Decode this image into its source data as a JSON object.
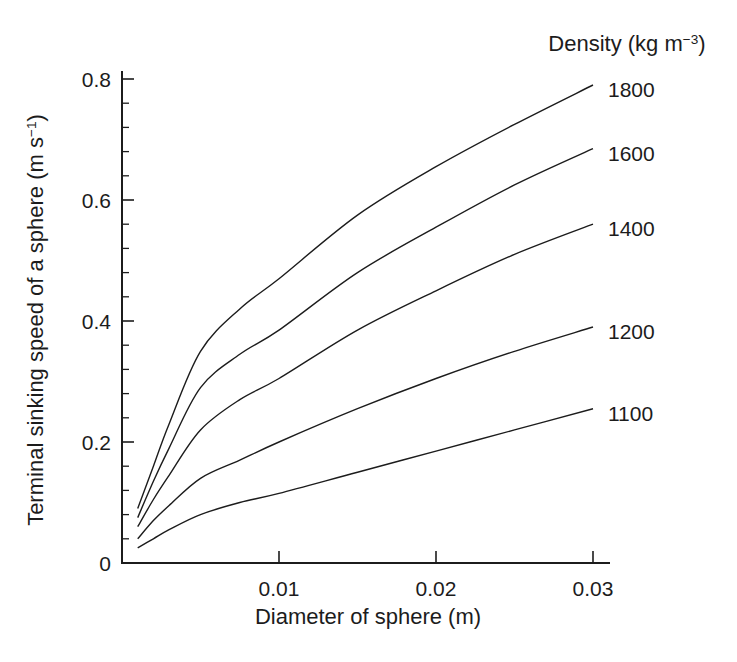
{
  "figure": {
    "background": "#ffffff",
    "ink": "#1c1c1c"
  },
  "labels": {
    "y_title": {
      "text": "Terminal sinking speed of a sphere (m s",
      "sup": "−1",
      "close": ")"
    },
    "x_title": {
      "text": "Diameter of sphere (m)"
    },
    "legend_title": {
      "text": "Density (kg m",
      "sup": "−3",
      "close": ")"
    }
  },
  "chart_data": {
    "type": "line",
    "title": "",
    "xlabel": "Diameter of sphere (m)",
    "ylabel": "Terminal sinking speed of a sphere (m s⁻¹)",
    "legend_title": "Density (kg m⁻³)",
    "legend_position": "labels-at-right-ends-of-curves",
    "grid": false,
    "xlim": [
      0,
      0.031
    ],
    "ylim": [
      0,
      0.81
    ],
    "x_ticks": [
      0.01,
      0.02,
      0.03
    ],
    "x_tick_labels": [
      "0.01",
      "0.02",
      "0.03"
    ],
    "y_ticks": [
      0,
      0.2,
      0.4,
      0.6,
      0.8
    ],
    "y_tick_labels": [
      "0",
      "0.2",
      "0.4",
      "0.6",
      "0.8"
    ],
    "y_minor_tick_step": 0.04,
    "line_color": "#1c1c1c",
    "x": [
      0.001,
      0.002,
      0.003,
      0.005,
      0.0075,
      0.01,
      0.015,
      0.02,
      0.025,
      0.03
    ],
    "series": [
      {
        "name": "1800",
        "values": [
          0.09,
          0.16,
          0.23,
          0.35,
          0.42,
          0.47,
          0.575,
          0.655,
          0.725,
          0.79
        ]
      },
      {
        "name": "1600",
        "values": [
          0.075,
          0.135,
          0.19,
          0.29,
          0.345,
          0.385,
          0.48,
          0.555,
          0.625,
          0.685
        ]
      },
      {
        "name": "1400",
        "values": [
          0.06,
          0.105,
          0.145,
          0.22,
          0.27,
          0.305,
          0.385,
          0.45,
          0.51,
          0.56
        ]
      },
      {
        "name": "1200",
        "values": [
          0.04,
          0.07,
          0.095,
          0.14,
          0.17,
          0.2,
          0.255,
          0.305,
          0.35,
          0.39
        ]
      },
      {
        "name": "1100",
        "values": [
          0.025,
          0.04,
          0.055,
          0.08,
          0.1,
          0.115,
          0.15,
          0.185,
          0.22,
          0.255
        ]
      }
    ]
  }
}
